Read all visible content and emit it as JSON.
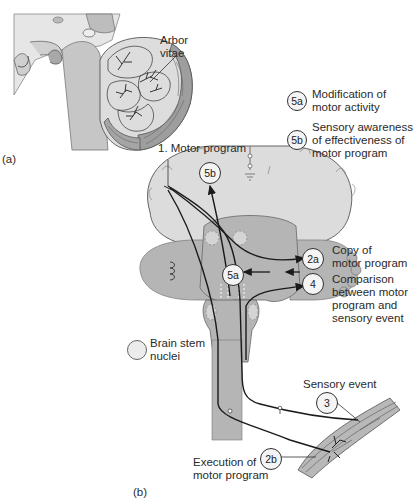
{
  "panel_a": {
    "label": "(a)",
    "arbor_vitae": "Arbor\nvitae",
    "arbor_line1": "Arbor",
    "arbor_line2": "vitae"
  },
  "legend": {
    "items": [
      {
        "badge": "5a",
        "line1": "Modification of",
        "line2": "motor activity"
      },
      {
        "badge": "5b",
        "line1": "Sensory awareness",
        "line2": "of effectiveness of",
        "line3": "motor program"
      }
    ]
  },
  "panel_b": {
    "label": "(b)",
    "motor_program": "1. Motor program",
    "badge_5b": "5b",
    "badge_5a": "5a",
    "badge_2a": "2a",
    "badge_4": "4",
    "badge_3": "3",
    "badge_2b": "2b",
    "copy_line1": "Copy of",
    "copy_line2": "motor program",
    "comparison_line1": "Comparison",
    "comparison_line2": "between motor",
    "comparison_line3": "program and",
    "comparison_line4": "sensory event",
    "brainstem_line1": "Brain stem",
    "brainstem_line2": "nuclei",
    "sensory_event": "Sensory event",
    "execution_line1": "Execution of",
    "execution_line2": "motor program"
  },
  "colors": {
    "tissue_light": "#dcdcdc",
    "tissue_mid": "#b5b5b5",
    "tissue_dark": "#9a9a9a",
    "line": "#1a1a1a",
    "background": "#ffffff"
  }
}
